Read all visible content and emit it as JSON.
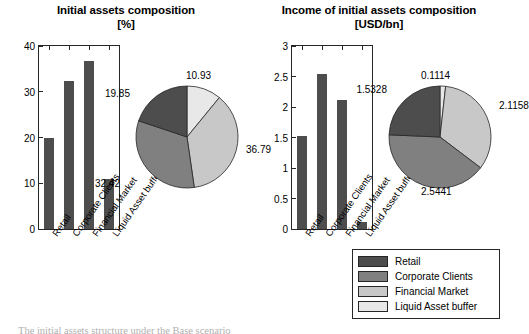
{
  "caption": "The initial assets structure under the Base scenario",
  "legend": {
    "items": [
      {
        "label": "Retail",
        "color": "#4d4d4d"
      },
      {
        "label": "Corporate Clients",
        "color": "#808080"
      },
      {
        "label": "Financial Market",
        "color": "#c8c8c8"
      },
      {
        "label": "Liquid Asset buffer",
        "color": "#e8e8e8"
      }
    ]
  },
  "chart_data": [
    {
      "type": "bar",
      "id": "initial-assets-bar",
      "title": "Initial assets composition",
      "unit": "[%]",
      "xlabel": "",
      "ylabel": "",
      "ylim": [
        0,
        40
      ],
      "yticks": [
        "0",
        "10",
        "20",
        "30",
        "40"
      ],
      "ytick_values": [
        0,
        10,
        20,
        30,
        40
      ],
      "grid": false,
      "categories": [
        "Retail",
        "Corporate Clients",
        "Financial Market",
        "Liquid Asset buffer"
      ],
      "values": [
        19.85,
        32.42,
        36.79,
        10.93
      ],
      "bar_color": "#4d4d4d"
    },
    {
      "type": "pie",
      "id": "initial-assets-pie",
      "title": "Initial assets composition",
      "unit": "[%]",
      "start_angle_deg": 0,
      "direction": "clockwise",
      "labels": [
        "Liquid Asset buffer",
        "Financial Market",
        "Corporate Clients",
        "Retail"
      ],
      "values": [
        10.93,
        36.79,
        32.42,
        19.85
      ],
      "value_labels": [
        "10.93",
        "36.79",
        "32.42",
        "19.85"
      ],
      "colors": [
        "#e8e8e8",
        "#c8c8c8",
        "#808080",
        "#4d4d4d"
      ]
    },
    {
      "type": "bar",
      "id": "income-bar",
      "title": "Income of initial assets composition",
      "unit": "[USD/bn]",
      "xlabel": "",
      "ylabel": "",
      "ylim": [
        0,
        3
      ],
      "yticks": [
        "0",
        "0.5",
        "1",
        "1.5",
        "2",
        "2.5",
        "3"
      ],
      "ytick_values": [
        0,
        0.5,
        1,
        1.5,
        2,
        2.5,
        3
      ],
      "grid": false,
      "categories": [
        "Retail",
        "Corporate Clients",
        "Financial Market",
        "Liquid Asset buffer"
      ],
      "values": [
        1.5328,
        2.5441,
        2.1158,
        0.1114
      ],
      "bar_color": "#4d4d4d"
    },
    {
      "type": "pie",
      "id": "income-pie",
      "title": "Income of initial assets composition",
      "unit": "[USD/bn]",
      "start_angle_deg": 0,
      "direction": "clockwise",
      "labels": [
        "Liquid Asset buffer",
        "Financial Market",
        "Corporate Clients",
        "Retail"
      ],
      "values": [
        0.1114,
        2.1158,
        2.5441,
        1.5328
      ],
      "value_labels": [
        "0.1114",
        "2.1158",
        "2.5441",
        "1.5328"
      ],
      "colors": [
        "#e8e8e8",
        "#c8c8c8",
        "#808080",
        "#4d4d4d"
      ]
    }
  ]
}
